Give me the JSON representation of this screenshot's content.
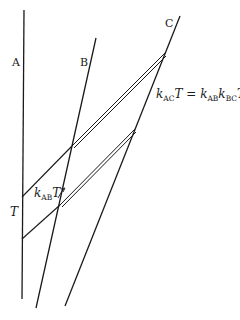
{
  "diagram": {
    "labels": {
      "line_a": "A",
      "line_b": "B",
      "line_c": "C",
      "period": "T",
      "kab_k": "k",
      "kab_sub": "AB",
      "kab_T": "T",
      "eq_k1": "k",
      "eq_sub1": "AC",
      "eq_T1": "T",
      "eq_equals": " = ",
      "eq_k2": "k",
      "eq_sub2": "AB",
      "eq_k3": "k",
      "eq_sub3": "BC",
      "eq_T2": "T"
    },
    "colors": {
      "line": "#1a1a1a",
      "background": "#ffffff"
    }
  }
}
